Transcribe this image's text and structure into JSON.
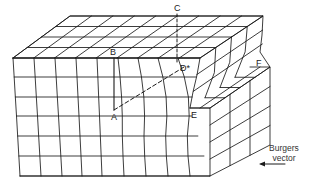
{
  "figure": {
    "labels": {
      "A": "A",
      "B": "B",
      "C": "C",
      "D": "D*",
      "E": "E",
      "F": "F"
    },
    "legend": {
      "line1": "Burgers",
      "line2": "vector",
      "arrow_direction": "left"
    },
    "colors": {
      "line": "#1a1a1a",
      "background": "#ffffff"
    }
  }
}
